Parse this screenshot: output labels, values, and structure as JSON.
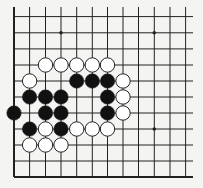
{
  "board": {
    "title": "Go board diagram",
    "colors": {
      "background": "#f4f4f2",
      "line": "#222222",
      "black_stone": "#111111",
      "white_stone": "#ffffff",
      "stone_outline": "#222222"
    },
    "columns_x": [
      14,
      29.6,
      45.5,
      61,
      76.7,
      92.3,
      107.5,
      123,
      138.5,
      154.3,
      170,
      185.6
    ],
    "rows_y": [
      16.6,
      32.8,
      48.9,
      65,
      81,
      97,
      113,
      129,
      145,
      161,
      177
    ],
    "edges": {
      "left": true,
      "bottom": true,
      "top": false,
      "right": false
    },
    "vertical_top": 7,
    "horizontal_right": 193,
    "star_points": [
      {
        "col": 3,
        "row": 1
      },
      {
        "col": 9,
        "row": 1
      },
      {
        "col": 9,
        "row": 7
      }
    ],
    "stones": [
      {
        "color": "white",
        "col": 2,
        "row": 3
      },
      {
        "color": "white",
        "col": 3,
        "row": 3
      },
      {
        "color": "white",
        "col": 4,
        "row": 3
      },
      {
        "color": "white",
        "col": 5,
        "row": 3
      },
      {
        "color": "white",
        "col": 6,
        "row": 3
      },
      {
        "color": "white",
        "col": 1,
        "row": 4
      },
      {
        "color": "black",
        "col": 4,
        "row": 4
      },
      {
        "color": "black",
        "col": 5,
        "row": 4
      },
      {
        "color": "black",
        "col": 6,
        "row": 4
      },
      {
        "color": "white",
        "col": 7,
        "row": 4
      },
      {
        "color": "black",
        "col": 1,
        "row": 5
      },
      {
        "color": "black",
        "col": 2,
        "row": 5
      },
      {
        "color": "black",
        "col": 3,
        "row": 5
      },
      {
        "color": "black",
        "col": 6,
        "row": 5
      },
      {
        "color": "white",
        "col": 7,
        "row": 5
      },
      {
        "color": "black",
        "col": 0,
        "row": 6
      },
      {
        "color": "black",
        "col": 2,
        "row": 6
      },
      {
        "color": "black",
        "col": 3,
        "row": 6
      },
      {
        "color": "black",
        "col": 6,
        "row": 6
      },
      {
        "color": "white",
        "col": 7,
        "row": 6
      },
      {
        "color": "black",
        "col": 1,
        "row": 7
      },
      {
        "color": "white",
        "col": 2,
        "row": 7
      },
      {
        "color": "black",
        "col": 3,
        "row": 7
      },
      {
        "color": "white",
        "col": 4,
        "row": 7
      },
      {
        "color": "white",
        "col": 5,
        "row": 7
      },
      {
        "color": "white",
        "col": 6,
        "row": 7
      },
      {
        "color": "white",
        "col": 1,
        "row": 8
      },
      {
        "color": "white",
        "col": 2,
        "row": 8
      },
      {
        "color": "white",
        "col": 3,
        "row": 8
      }
    ],
    "stone_radius": 7.2
  }
}
